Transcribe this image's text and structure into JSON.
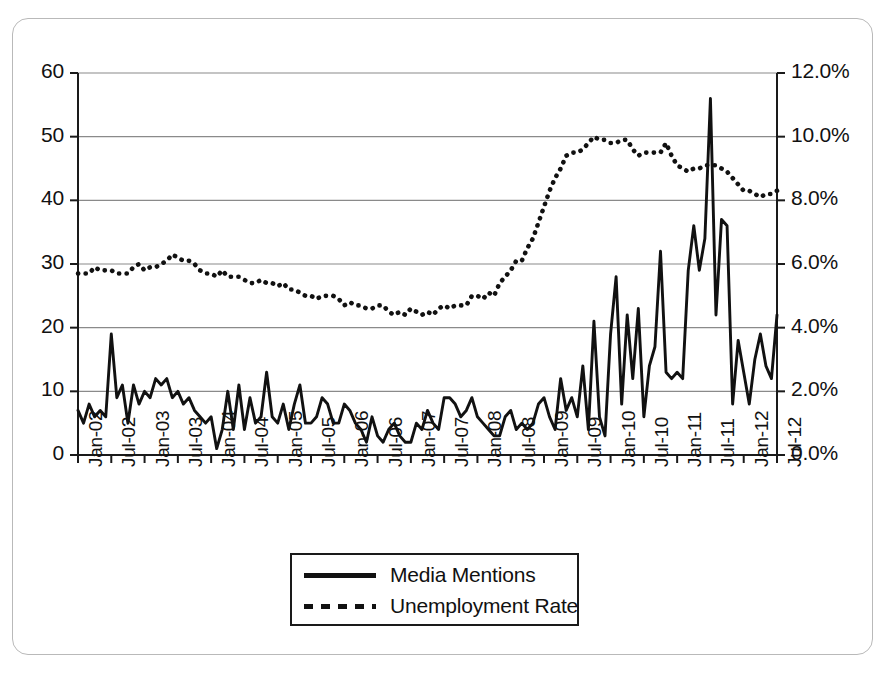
{
  "chart_data": {
    "type": "line",
    "title": "",
    "subtitle": "",
    "xlabel": "",
    "ylabel": "",
    "ylabel_right": "",
    "grid": true,
    "legend_position": "bottom-center",
    "x_start": "Jan-02",
    "x_end": "Jul-12",
    "x_tick_interval_months": 6,
    "x": [
      "Jan-02",
      "Feb-02",
      "Mar-02",
      "Apr-02",
      "May-02",
      "Jun-02",
      "Jul-02",
      "Aug-02",
      "Sep-02",
      "Oct-02",
      "Nov-02",
      "Dec-02",
      "Jan-03",
      "Feb-03",
      "Mar-03",
      "Apr-03",
      "May-03",
      "Jun-03",
      "Jul-03",
      "Aug-03",
      "Sep-03",
      "Oct-03",
      "Nov-03",
      "Dec-03",
      "Jan-04",
      "Feb-04",
      "Mar-04",
      "Apr-04",
      "May-04",
      "Jun-04",
      "Jul-04",
      "Aug-04",
      "Sep-04",
      "Oct-04",
      "Nov-04",
      "Dec-04",
      "Jan-05",
      "Feb-05",
      "Mar-05",
      "Apr-05",
      "May-05",
      "Jun-05",
      "Jul-05",
      "Aug-05",
      "Sep-05",
      "Oct-05",
      "Nov-05",
      "Dec-05",
      "Jan-06",
      "Feb-06",
      "Mar-06",
      "Apr-06",
      "May-06",
      "Jun-06",
      "Jul-06",
      "Aug-06",
      "Sep-06",
      "Oct-06",
      "Nov-06",
      "Dec-06",
      "Jan-07",
      "Feb-07",
      "Mar-07",
      "Apr-07",
      "May-07",
      "Jun-07",
      "Jul-07",
      "Aug-07",
      "Sep-07",
      "Oct-07",
      "Nov-07",
      "Dec-07",
      "Jan-08",
      "Feb-08",
      "Mar-08",
      "Apr-08",
      "May-08",
      "Jun-08",
      "Jul-08",
      "Aug-08",
      "Sep-08",
      "Oct-08",
      "Nov-08",
      "Dec-08",
      "Jan-09",
      "Feb-09",
      "Mar-09",
      "Apr-09",
      "May-09",
      "Jun-09",
      "Jul-09",
      "Aug-09",
      "Sep-09",
      "Oct-09",
      "Nov-09",
      "Dec-09",
      "Jan-10",
      "Feb-10",
      "Mar-10",
      "Apr-10",
      "May-10",
      "Jun-10",
      "Jul-10",
      "Aug-10",
      "Sep-10",
      "Oct-10",
      "Nov-10",
      "Dec-10",
      "Jan-11",
      "Feb-11",
      "Mar-11",
      "Apr-11",
      "May-11",
      "Jun-11",
      "Jul-11",
      "Aug-11",
      "Sep-11",
      "Oct-11",
      "Nov-11",
      "Dec-11",
      "Jan-12",
      "Feb-12",
      "Mar-12",
      "Apr-12",
      "May-12",
      "Jun-12",
      "Jul-12"
    ],
    "x_tick_labels": [
      "Jan-02",
      "Jul-02",
      "Jan-03",
      "Jul-03",
      "Jan-04",
      "Jul-04",
      "Jan-05",
      "Jul-05",
      "Jan-06",
      "Jul-06",
      "Jan-07",
      "Jul-07",
      "Jan-08",
      "Jul-08",
      "Jan-09",
      "Jul-09",
      "Jan-10",
      "Jul-10",
      "Jan-11",
      "Jul-11",
      "Jan-12",
      "Jul-12"
    ],
    "y_left": {
      "label": "",
      "ticks": [
        0,
        10,
        20,
        30,
        40,
        50,
        60
      ],
      "tick_labels": [
        "0",
        "10",
        "20",
        "30",
        "40",
        "50",
        "60"
      ],
      "lim": [
        0,
        60
      ]
    },
    "y_right": {
      "label": "",
      "ticks": [
        0,
        2,
        4,
        6,
        8,
        10,
        12
      ],
      "tick_labels": [
        "0.0%",
        "2.0%",
        "4.0%",
        "6.0%",
        "8.0%",
        "10.0%",
        "12.0%"
      ],
      "lim": [
        0,
        12
      ]
    },
    "series": [
      {
        "name": "Media Mentions",
        "axis": "left",
        "style": "solid",
        "color": "#111111",
        "values": [
          7,
          5,
          8,
          6,
          7,
          6,
          19,
          9,
          11,
          5,
          11,
          8,
          10,
          9,
          12,
          11,
          12,
          9,
          10,
          8,
          9,
          7,
          6,
          5,
          6,
          1,
          4,
          10,
          4,
          11,
          4,
          9,
          5,
          6,
          13,
          6,
          5,
          8,
          4,
          8,
          11,
          5,
          5,
          6,
          9,
          8,
          5,
          5,
          8,
          7,
          5,
          4,
          2,
          6,
          3,
          2,
          4,
          5,
          3,
          2,
          2,
          5,
          4,
          7,
          5,
          4,
          9,
          9,
          8,
          6,
          7,
          9,
          6,
          5,
          4,
          3,
          3,
          6,
          7,
          4,
          5,
          4,
          5,
          8,
          9,
          6,
          4,
          12,
          7,
          9,
          6,
          14,
          4,
          21,
          6,
          3,
          19,
          28,
          8,
          22,
          12,
          23,
          6,
          14,
          17,
          32,
          13,
          12,
          13,
          12,
          29,
          36,
          29,
          34,
          56,
          22,
          37,
          36,
          8,
          18,
          13,
          8,
          15,
          19,
          14,
          12,
          22
        ]
      },
      {
        "name": "Unemployment Rate",
        "axis": "right",
        "style": "dotted",
        "color": "#111111",
        "values": [
          5.7,
          5.7,
          5.7,
          5.9,
          5.8,
          5.8,
          5.8,
          5.7,
          5.7,
          5.7,
          5.9,
          6.0,
          5.8,
          5.9,
          5.9,
          6.0,
          6.1,
          6.3,
          6.2,
          6.1,
          6.1,
          6.0,
          5.8,
          5.7,
          5.7,
          5.6,
          5.8,
          5.6,
          5.6,
          5.6,
          5.5,
          5.4,
          5.4,
          5.5,
          5.4,
          5.4,
          5.3,
          5.4,
          5.2,
          5.2,
          5.1,
          5.0,
          5.0,
          4.9,
          5.0,
          5.0,
          5.0,
          4.9,
          4.7,
          4.8,
          4.7,
          4.7,
          4.6,
          4.6,
          4.7,
          4.7,
          4.5,
          4.4,
          4.5,
          4.4,
          4.6,
          4.5,
          4.4,
          4.5,
          4.4,
          4.6,
          4.7,
          4.6,
          4.7,
          4.7,
          4.7,
          5.0,
          5.0,
          4.9,
          5.1,
          5.0,
          5.4,
          5.6,
          5.8,
          6.1,
          6.1,
          6.5,
          6.8,
          7.3,
          7.8,
          8.3,
          8.7,
          9.0,
          9.4,
          9.5,
          9.5,
          9.6,
          9.8,
          10.0,
          9.9,
          9.9,
          9.8,
          9.8,
          9.9,
          9.9,
          9.6,
          9.4,
          9.5,
          9.5,
          9.5,
          9.5,
          9.8,
          9.4,
          9.1,
          9.0,
          8.9,
          9.0,
          9.0,
          9.1,
          9.1,
          9.1,
          9.0,
          8.9,
          8.7,
          8.5,
          8.3,
          8.3,
          8.2,
          8.1,
          8.2,
          8.2,
          8.3
        ]
      }
    ]
  },
  "legend": {
    "items": [
      {
        "label": "Media Mentions",
        "style": "solid"
      },
      {
        "label": "Unemployment Rate",
        "style": "dotted"
      }
    ]
  },
  "colors": {
    "series": "#111111",
    "gridline": "#8a8a8a",
    "axis": "#1a1a1a",
    "frame": "#b9b9b9",
    "background": "#ffffff"
  }
}
